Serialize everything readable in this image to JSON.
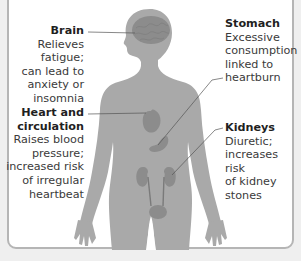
{
  "diagram": {
    "type": "anatomical-callout",
    "top_caption_cut": "",
    "colors": {
      "background": "#efefef",
      "panel": "#ffffff",
      "panel_border": "#b5b5b5",
      "body": "#a9a9a9",
      "organ": "#8c8c8c",
      "leader_line": "#555555",
      "title_text": "#1f1f1f",
      "body_text": "#3a3a3a"
    },
    "callouts": [
      {
        "organ": "brain",
        "title": "Brain",
        "lines": [
          "Relieves fatigue;",
          "can lead to",
          "anxiety or",
          "insomnia"
        ]
      },
      {
        "organ": "heart",
        "title_lines": [
          "Heart and",
          "circulation"
        ],
        "lines": [
          "Raises blood",
          "pressure;",
          "increased risk",
          "of irregular",
          "heartbeat"
        ]
      },
      {
        "organ": "stomach",
        "title": "Stomach",
        "lines": [
          "Excessive",
          "consumption",
          "linked to",
          "heartburn"
        ]
      },
      {
        "organ": "kidneys",
        "title": "Kidneys",
        "lines": [
          "Diuretic;",
          "increases risk",
          "of kidney",
          "stones"
        ]
      }
    ]
  }
}
